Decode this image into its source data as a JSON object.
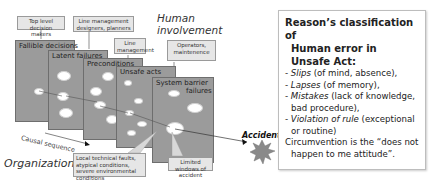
{
  "diagram": {
    "top_labels": {
      "top_level": "Top level decision makers",
      "line_mgmt_designers": "Line management designers, planners",
      "line_mgmt": "Line management",
      "operators": "Operators, maintenence"
    },
    "human_involvement": [
      "Human",
      "involvement"
    ],
    "slices": [
      {
        "title": "Fallible decisions"
      },
      {
        "title": "Latent failures"
      },
      {
        "title": "Preconditions"
      },
      {
        "title": "Unsafe acts"
      },
      {
        "title": "System barrier",
        "title2": "failures"
      }
    ],
    "causal_sequence": "Causal sequence",
    "organization": "Organization",
    "bottom_labels": {
      "local_faults": "Local technical faults, atypical conditions, severe environmental conditions",
      "limited_windows": "Limited windows of accident"
    },
    "accident": "Accident",
    "colors": {
      "slice": "#9b9b9b",
      "label_bg": "#e6e6e6",
      "burst": "#8a8a8a"
    }
  },
  "info_box": {
    "title_line1": "Reason’s classification of",
    "title_line2": "Human error in Unsafe Act:",
    "items": [
      {
        "term": "Slips",
        "desc": " (of mind, absence),"
      },
      {
        "term": "Lapses",
        "desc": " (of memory),"
      },
      {
        "term": "Mistakes",
        "desc": " (lack of knowledge,",
        "cont": "bad procedure),"
      },
      {
        "term": "Violation of rule",
        "desc": " (exceptional",
        "cont": "or routine)"
      }
    ],
    "circumvention_line1": "Circumvention is the “does not",
    "circumvention_line2": "happen to me attitude”."
  }
}
